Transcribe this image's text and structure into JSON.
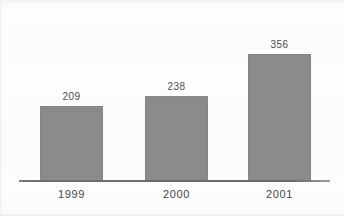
{
  "chart_data": {
    "type": "bar",
    "title": "",
    "subtitle": "",
    "xlabel": "",
    "ylabel": "",
    "categories": [
      "1999",
      "2000",
      "2001"
    ],
    "values": [
      209,
      238,
      356
    ],
    "value_labels": [
      "209",
      "238",
      "356"
    ],
    "ylim": [
      0,
      420
    ],
    "grid": false,
    "legend": null,
    "bar_color": "#8b8b8b",
    "axis_color": "#6a6a6a",
    "label_color": "#464646",
    "value_label_color": "#4c4c4c",
    "background_color": "#fdfdfd",
    "axis": {
      "baseline_visible": true,
      "y_axis_visible": false,
      "tick_labels_y": []
    }
  }
}
